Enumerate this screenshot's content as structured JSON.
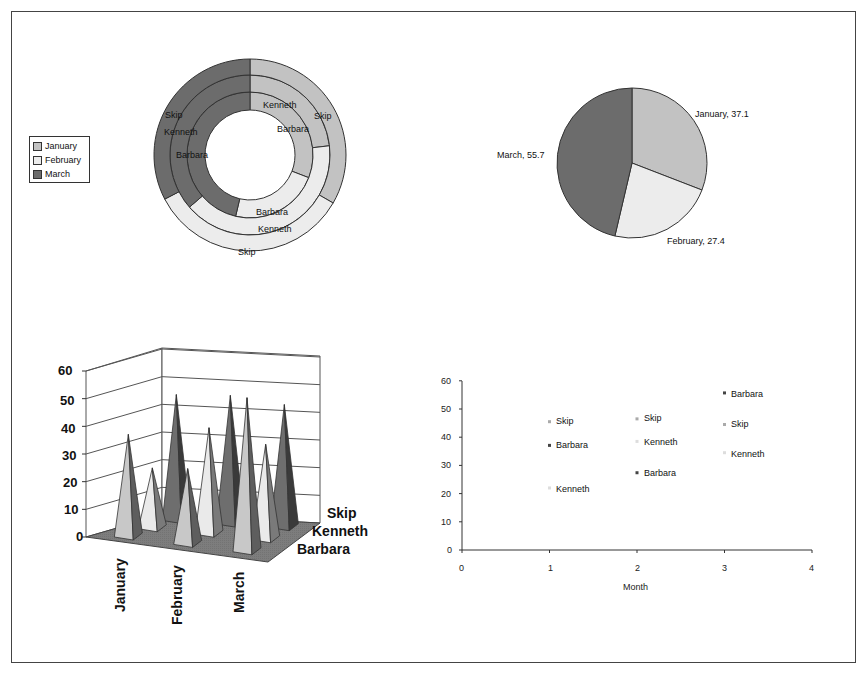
{
  "colors": {
    "january": "#c2c2c2",
    "february": "#ececec",
    "march": "#6c6c6c",
    "march_dark": "#4d4d4d",
    "floor": "#7d7d7d",
    "border": "#444444"
  },
  "legend": {
    "items": [
      {
        "label": "January"
      },
      {
        "label": "February"
      },
      {
        "label": "March"
      }
    ]
  },
  "doughnut": {
    "rings": [
      {
        "label": "Barbara",
        "jan_label": "Barbara",
        "feb_label": "Barbara",
        "mar_label": "Barbara"
      },
      {
        "label": "Kenneth",
        "jan_label": "Kenneth",
        "feb_label": "Kenneth",
        "mar_label": "Kenneth"
      },
      {
        "label": "Skip",
        "jan_label": "Skip",
        "feb_label": "Skip",
        "mar_label": "Skip"
      }
    ]
  },
  "pie": {
    "labels": [
      "January, 37.1",
      "February, 27.4",
      "March, 55.7"
    ]
  },
  "cone3d": {
    "y_ticks": [
      "0",
      "10",
      "20",
      "30",
      "40",
      "50",
      "60"
    ],
    "months": [
      "January",
      "February",
      "March"
    ],
    "series_labels": [
      "Skip",
      "Kenneth",
      "Barbara"
    ]
  },
  "scatter": {
    "y_ticks": [
      "0",
      "10",
      "20",
      "30",
      "40",
      "50",
      "60"
    ],
    "x_ticks": [
      "0",
      "1",
      "2",
      "3",
      "4"
    ],
    "xlabel": "Month",
    "point_labels": {
      "m1_skip": "Skip",
      "m1_barbara": "Barbara",
      "m1_kenneth": "Kenneth",
      "m2_skip": "Skip",
      "m2_kenneth": "Kenneth",
      "m2_barbara": "Barbara",
      "m3_barbara": "Barbara",
      "m3_skip": "Skip",
      "m3_kenneth": "Kenneth"
    }
  },
  "chart_data": [
    {
      "type": "doughnut",
      "title": "",
      "categories": [
        "January",
        "February",
        "March"
      ],
      "series": [
        {
          "name": "Barbara",
          "ring": "inner",
          "values": [
            37.1,
            27.4,
            55.7
          ]
        },
        {
          "name": "Kenneth",
          "ring": "middle",
          "values": [
            22,
            38.5,
            34.5
          ]
        },
        {
          "name": "Skip",
          "ring": "outer",
          "values": [
            45.5,
            46.5,
            44.5
          ]
        }
      ],
      "legend": [
        "January",
        "February",
        "March"
      ],
      "legend_position": "left"
    },
    {
      "type": "pie",
      "title": "",
      "categories": [
        "January",
        "February",
        "March"
      ],
      "values": [
        37.1,
        27.4,
        55.7
      ],
      "data_labels": [
        "January, 37.1",
        "February, 27.4",
        "March, 55.7"
      ]
    },
    {
      "type": "bar",
      "subtype": "3d-cone",
      "title": "",
      "categories": [
        "January",
        "February",
        "March"
      ],
      "series": [
        {
          "name": "Barbara",
          "values": [
            37.1,
            27.4,
            55.7
          ]
        },
        {
          "name": "Kenneth",
          "values": [
            22,
            38.5,
            34.5
          ]
        },
        {
          "name": "Skip",
          "values": [
            45.5,
            46.5,
            44.5
          ]
        }
      ],
      "ylim": [
        0,
        60
      ],
      "y_ticks": [
        0,
        10,
        20,
        30,
        40,
        50,
        60
      ],
      "grid": true
    },
    {
      "type": "scatter",
      "title": "",
      "xlabel": "Month",
      "ylabel": "",
      "xlim": [
        0,
        4
      ],
      "ylim": [
        0,
        60
      ],
      "x_ticks": [
        0,
        1,
        2,
        3,
        4
      ],
      "y_ticks": [
        0,
        10,
        20,
        30,
        40,
        50,
        60
      ],
      "series": [
        {
          "name": "Barbara",
          "x": [
            1,
            2,
            3
          ],
          "y": [
            37.1,
            27.4,
            55.7
          ]
        },
        {
          "name": "Kenneth",
          "x": [
            1,
            2,
            3
          ],
          "y": [
            22,
            38.5,
            34.5
          ]
        },
        {
          "name": "Skip",
          "x": [
            1,
            2,
            3
          ],
          "y": [
            45.5,
            46.5,
            44.5
          ]
        }
      ],
      "grid": false
    }
  ]
}
